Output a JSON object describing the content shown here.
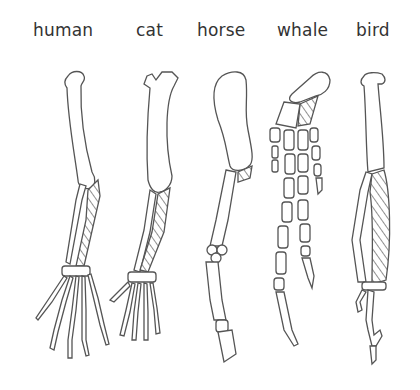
{
  "diagram": {
    "type": "homologous forelimb structures",
    "labels": [
      {
        "id": "human",
        "text": "human"
      },
      {
        "id": "cat",
        "text": "cat"
      },
      {
        "id": "horse",
        "text": "horse"
      },
      {
        "id": "whale",
        "text": "whale"
      },
      {
        "id": "bird",
        "text": "bird"
      }
    ]
  }
}
